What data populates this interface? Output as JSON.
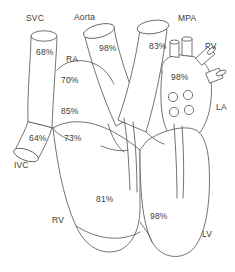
{
  "diagram": {
    "type": "anatomical-schematic",
    "line_color": "#5a5a5a",
    "text_color": "#3b3b3b",
    "background_color": "#ffffff",
    "structures": [
      {
        "id": "svc",
        "label": "SVC",
        "full_name": "Superior Vena Cava",
        "x": 26,
        "y": 14
      },
      {
        "id": "aorta",
        "label": "Aorta",
        "full_name": "Aorta",
        "x": 74,
        "y": 13
      },
      {
        "id": "mpa",
        "label": "MPA",
        "full_name": "Main Pulmonary Artery",
        "x": 178,
        "y": 14
      },
      {
        "id": "pv",
        "label": "PV",
        "full_name": "Pulmonary Veins",
        "x": 205,
        "y": 42
      },
      {
        "id": "la",
        "label": "LA",
        "full_name": "Left Atrium",
        "x": 216,
        "y": 103
      },
      {
        "id": "ra",
        "label": "RA",
        "full_name": "Right Atrium",
        "x": 66,
        "y": 55
      },
      {
        "id": "ivc",
        "label": "IVC",
        "full_name": "Inferior Vena Cava",
        "x": 14,
        "y": 161
      },
      {
        "id": "rv",
        "label": "RV",
        "full_name": "Right Ventricle",
        "x": 52,
        "y": 216
      },
      {
        "id": "lv",
        "label": "LV",
        "full_name": "Left Ventricle",
        "x": 202,
        "y": 230
      }
    ],
    "saturations": [
      {
        "id": "sat-svc",
        "site": "SVC",
        "value": "68%",
        "x": 36,
        "y": 48
      },
      {
        "id": "sat-aorta",
        "site": "Aorta",
        "value": "98%",
        "x": 99,
        "y": 44
      },
      {
        "id": "sat-mpa",
        "site": "MPA",
        "value": "83%",
        "x": 149,
        "y": 42
      },
      {
        "id": "sat-la",
        "site": "LA",
        "value": "98%",
        "x": 171,
        "y": 73
      },
      {
        "id": "sat-ra-hi",
        "site": "RA high",
        "value": "70%",
        "x": 61,
        "y": 76
      },
      {
        "id": "sat-ra-mid",
        "site": "RA mid",
        "value": "85%",
        "x": 61,
        "y": 107
      },
      {
        "id": "sat-ra-low",
        "site": "RA low",
        "value": "73%",
        "x": 64,
        "y": 134
      },
      {
        "id": "sat-ivc",
        "site": "IVC",
        "value": "64%",
        "x": 29,
        "y": 134
      },
      {
        "id": "sat-rv",
        "site": "RV",
        "value": "81%",
        "x": 96,
        "y": 195
      },
      {
        "id": "sat-lv",
        "site": "LV",
        "value": "98%",
        "x": 150,
        "y": 212
      }
    ],
    "la_vein_openings_count": 4
  }
}
